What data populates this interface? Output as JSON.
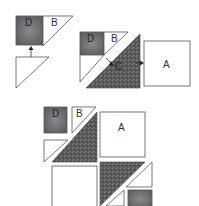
{
  "diagram": {
    "colors": {
      "dark_square": "#6e6e6e",
      "dark_triangle": "#5a5a5a",
      "light_piece": "#ffffff",
      "outline": "#555555"
    },
    "step1": {
      "labels": {
        "d": "D",
        "b": "B"
      }
    },
    "step2": {
      "labels": {
        "d": "D",
        "b": "B",
        "c": "C",
        "a": "A"
      }
    },
    "step3": {
      "labels": {
        "d": "D",
        "b": "B",
        "a": "A"
      }
    }
  }
}
